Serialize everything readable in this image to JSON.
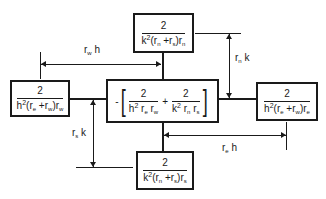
{
  "boxes": {
    "top": {
      "numerator": "2",
      "den_prefix": "k",
      "den_exp": "2",
      "den_body": [
        "(r",
        "n",
        " +r",
        "s",
        ")r",
        "n"
      ]
    },
    "left": {
      "numerator": "2",
      "den_prefix": "h",
      "den_exp": "2",
      "den_body": [
        "(r",
        "e",
        " +r",
        "w",
        ")r",
        "w"
      ]
    },
    "right": {
      "numerator": "2",
      "den_prefix": "h",
      "den_exp": "2",
      "den_body": [
        "(r",
        "e",
        " +r",
        "w",
        ")r",
        "e"
      ]
    },
    "bottom": {
      "numerator": "2",
      "den_prefix": "k",
      "den_exp": "2",
      "den_body": [
        "(r",
        "n",
        " +r",
        "s",
        ")r",
        "s"
      ]
    },
    "center": {
      "sign": "-",
      "open_bracket": "[",
      "close_bracket": "]",
      "plus": "+",
      "term1": {
        "numerator": "2",
        "den_prefix": "h",
        "den_exp": "2",
        "den_body": [
          " r",
          "e",
          " r",
          "w"
        ]
      },
      "term2": {
        "numerator": "2",
        "den_prefix": "k",
        "den_exp": "2",
        "den_body": [
          " r",
          "n",
          "  r",
          "s"
        ]
      }
    }
  },
  "dimensions": {
    "rw_h": {
      "var": "r",
      "sub": "w",
      "factor": " h"
    },
    "rn_k": {
      "var": "r",
      "sub": "n",
      "factor": " k"
    },
    "rs_k": {
      "var": "r",
      "sub": "s",
      "factor": " k"
    },
    "re_h": {
      "var": "r",
      "sub": "e",
      "factor": " h"
    }
  }
}
